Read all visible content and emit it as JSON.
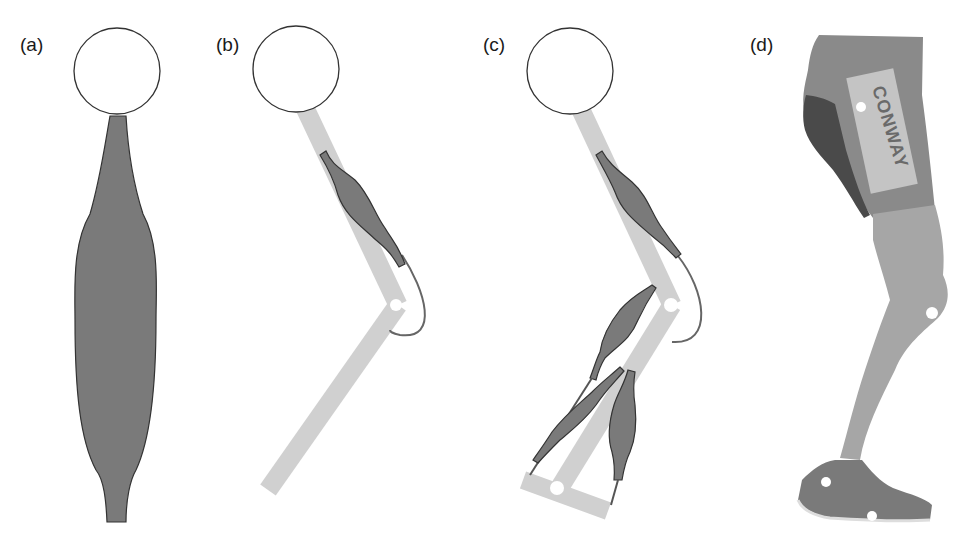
{
  "figure": {
    "panels": [
      {
        "id": "a",
        "label": "(a)",
        "description": "Single muscle attached below a circle (hip)"
      },
      {
        "id": "b",
        "label": "(b)",
        "description": "Thigh and shank segments with one biarticular muscle"
      },
      {
        "id": "c",
        "label": "(c)",
        "description": "Leg model with thigh, shank, foot segments and multiple muscles"
      },
      {
        "id": "d",
        "label": "(d)",
        "description": "Photo of human leg with markers"
      }
    ],
    "photo_text": "CONWAY",
    "colors": {
      "muscle": "#7a7a7a",
      "muscle_outline": "#333333",
      "bone": "#d0d0d0",
      "joint": "#ffffff",
      "outline": "#333333"
    }
  }
}
